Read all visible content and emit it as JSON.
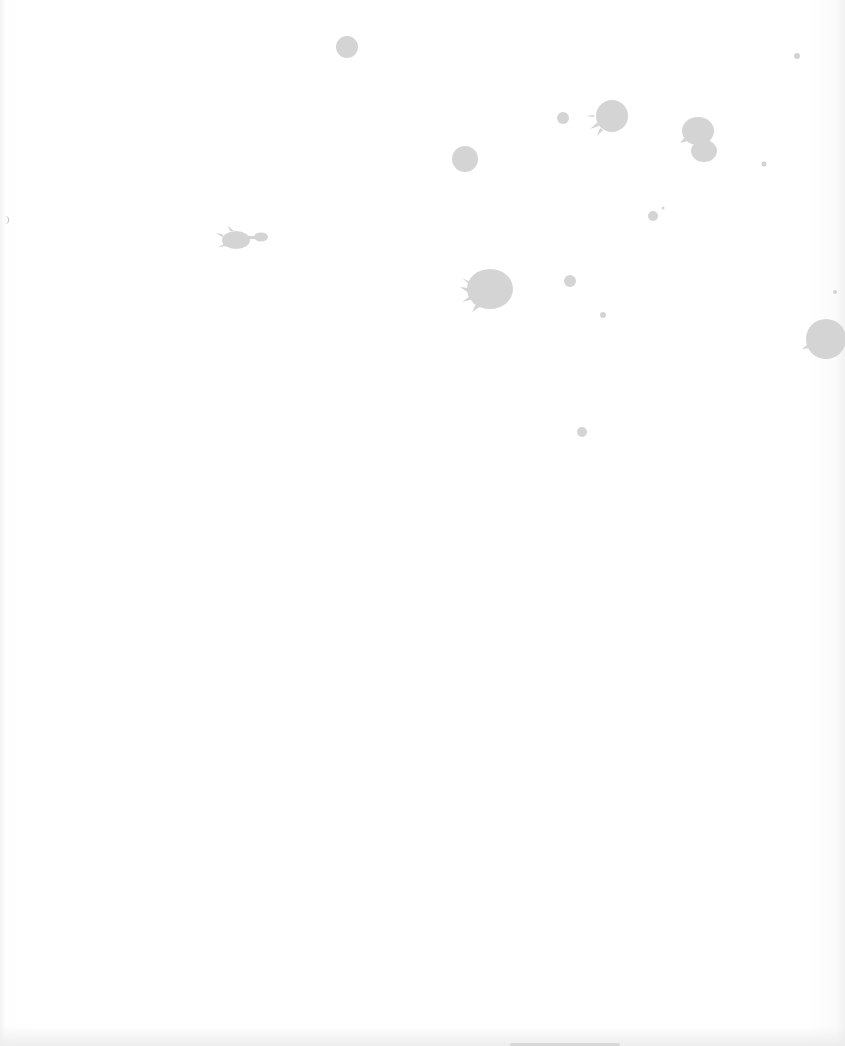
{
  "page": {
    "background_color": "#ffffff",
    "splatter_color": "#d4d4d4"
  },
  "splatters": [
    {
      "name": "splat-top-center",
      "cx": 347,
      "cy": 47,
      "r": 11
    },
    {
      "name": "splat-upper-mid",
      "cx": 465,
      "cy": 159,
      "r": 13
    },
    {
      "name": "splat-large-right-top",
      "cx": 611,
      "cy": 116,
      "r": 16
    },
    {
      "name": "splat-small-left-of-large",
      "cx": 563,
      "cy": 118,
      "r": 6
    },
    {
      "name": "splat-double-top-right-a",
      "cx": 698,
      "cy": 131,
      "r": 15
    },
    {
      "name": "splat-double-top-right-b",
      "cx": 703,
      "cy": 151,
      "r": 12
    },
    {
      "name": "splat-dot-far-right",
      "cx": 797,
      "cy": 56,
      "r": 3
    },
    {
      "name": "splat-dot-right",
      "cx": 764,
      "cy": 164,
      "r": 2
    },
    {
      "name": "splat-small-mid-right",
      "cx": 653,
      "cy": 216,
      "r": 5
    },
    {
      "name": "splat-left-elongated",
      "cx": 236,
      "cy": 239,
      "r": 12
    },
    {
      "name": "splat-left-tail",
      "cx": 261,
      "cy": 237,
      "r": 6
    },
    {
      "name": "splat-big-center",
      "cx": 489,
      "cy": 289,
      "r": 23
    },
    {
      "name": "splat-small-center-right",
      "cx": 570,
      "cy": 281,
      "r": 6
    },
    {
      "name": "splat-tiny-center-right",
      "cx": 603,
      "cy": 315,
      "r": 3
    },
    {
      "name": "splat-edge-right",
      "cx": 826,
      "cy": 339,
      "r": 19
    },
    {
      "name": "splat-dot-edge-right",
      "cx": 835,
      "cy": 292,
      "r": 2
    },
    {
      "name": "splat-lower-center",
      "cx": 582,
      "cy": 432,
      "r": 5
    }
  ]
}
